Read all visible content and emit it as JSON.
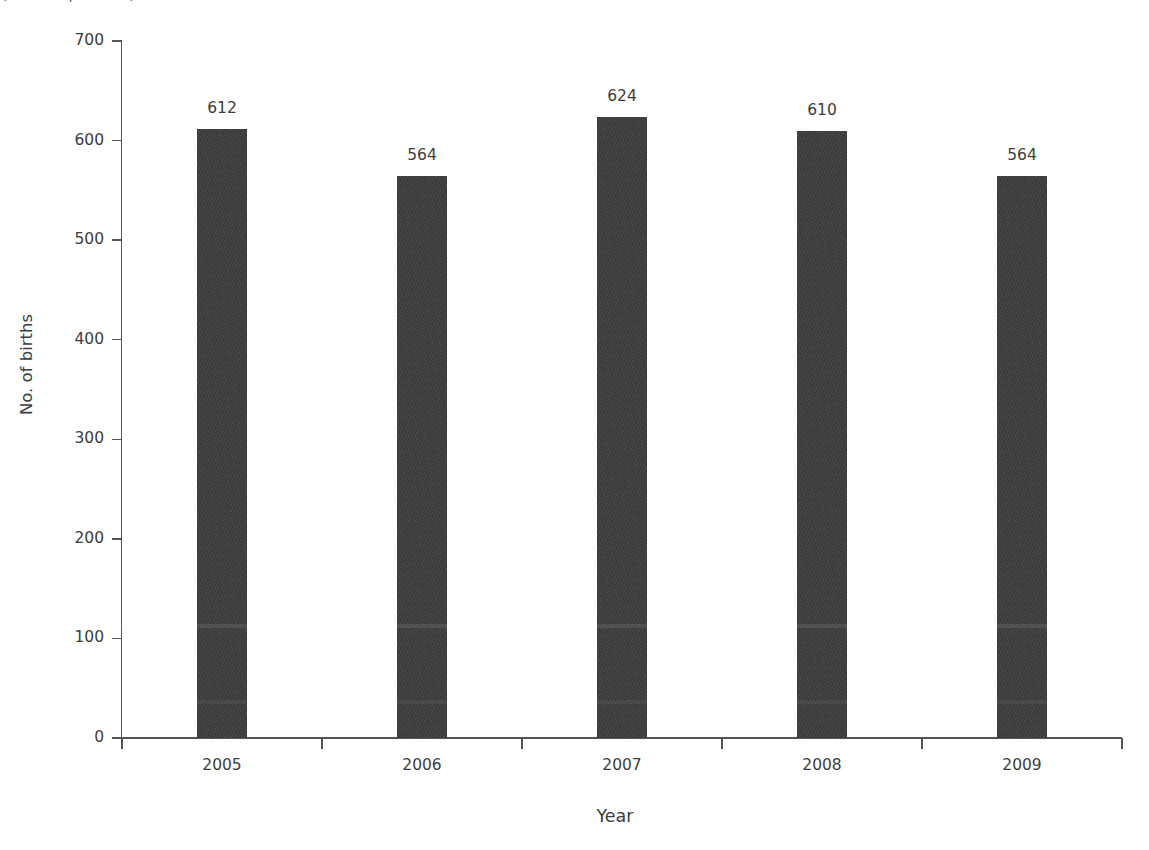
{
  "caption": {
    "text": "(cut-off caption line)"
  },
  "chart_data": {
    "type": "bar",
    "title": "",
    "subtitle": "",
    "categories": [
      "2005",
      "2006",
      "2007",
      "2008",
      "2009"
    ],
    "values": [
      612,
      564,
      624,
      610,
      564
    ],
    "series": [
      {
        "name": "No. of births",
        "values": [
          612,
          564,
          624,
          610,
          564
        ]
      }
    ],
    "data_labels": [
      "612",
      "564",
      "624",
      "610",
      "564"
    ],
    "xlabel": "Year",
    "ylabel": "No. of births",
    "ylim": [
      0,
      700
    ],
    "ytick_values": [
      0,
      100,
      200,
      300,
      400,
      500,
      600,
      700
    ],
    "ytick_labels": [
      "0",
      "100",
      "200",
      "300",
      "400",
      "500",
      "600",
      "700"
    ],
    "xtick_labels": [
      "2005",
      "2006",
      "2007",
      "2008",
      "2009"
    ],
    "grid": false,
    "legend": false,
    "legend_position": "none",
    "bar_color": "#3a3a3c",
    "axis_color": "#555558",
    "text_color": "#3d3d3d",
    "background_color": "#ffffff"
  }
}
